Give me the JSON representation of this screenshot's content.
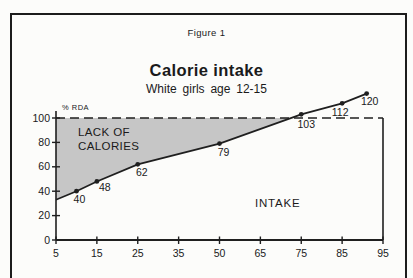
{
  "figure": {
    "label": "Figure 1"
  },
  "title": "Calorie intake",
  "subtitle": "White girls age 12-15",
  "labels": {
    "rda": "% RDA",
    "lack_line1": "LACK OF",
    "lack_line2": "CALORIES",
    "intake": "INTAKE"
  },
  "chart_data": {
    "type": "line",
    "title": "Calorie intake",
    "subtitle": "White girls age 12-15",
    "ylabel": "% RDA",
    "xlabel": "",
    "x_ticks": [
      5,
      15,
      25,
      35,
      50,
      65,
      75,
      85,
      95
    ],
    "y_ticks": [
      0,
      20,
      40,
      60,
      80,
      100
    ],
    "ylim": [
      0,
      100
    ],
    "grid": false,
    "reference_line": {
      "y": 100,
      "style": "dashed"
    },
    "series": [
      {
        "name": "Calorie intake (% RDA)",
        "points": [
          {
            "x": 5,
            "y": 33,
            "marker": false
          },
          {
            "x": 10,
            "y": 40,
            "label": "40",
            "dx": 3,
            "dy": 12
          },
          {
            "x": 15,
            "y": 48,
            "label": "48",
            "dx": 8,
            "dy": 10
          },
          {
            "x": 25,
            "y": 62,
            "label": "62",
            "dx": 4,
            "dy": 12
          },
          {
            "x": 50,
            "y": 79,
            "label": "79",
            "dx": 4,
            "dy": 12
          },
          {
            "x": 75,
            "y": 103,
            "label": "103",
            "dx": 5,
            "dy": 14
          },
          {
            "x": 85,
            "y": 112,
            "label": "112",
            "dx": -2,
            "dy": 13
          },
          {
            "x": 91,
            "y": 120,
            "label": "120",
            "dx": 3,
            "dy": 11
          }
        ]
      }
    ],
    "areas": [
      {
        "label": "LACK OF CALORIES",
        "description": "gap between intake curve and 100% RDA dashed line",
        "fill": "#c6c6c6"
      },
      {
        "label": "INTAKE",
        "description": "region below the intake curve"
      }
    ],
    "colors": {
      "line": "#1f1f1f",
      "shade": "#c6c6c6",
      "text": "#1a1a1a"
    }
  }
}
